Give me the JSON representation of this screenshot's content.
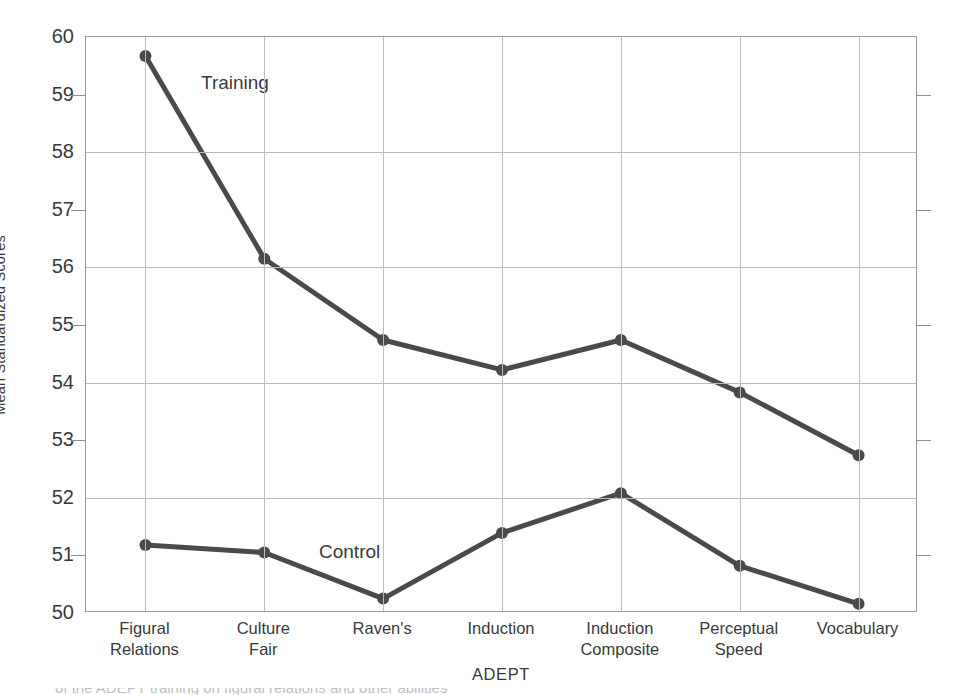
{
  "chart_data": {
    "type": "line",
    "title": "",
    "xlabel": "ADEPT",
    "ylabel": "Mean Standardized Scores",
    "ylim": [
      50,
      60
    ],
    "ytick_labels": [
      "60",
      "59",
      "58",
      "57",
      "56",
      "55",
      "54",
      "53",
      "52",
      "51",
      "50"
    ],
    "ytick_values": [
      60,
      59,
      58,
      57,
      56,
      55,
      54,
      53,
      52,
      51,
      50
    ],
    "gridline_values": [
      60,
      58,
      56,
      54,
      52,
      50
    ],
    "minor_tick_values": [
      59,
      57,
      55,
      53,
      51
    ],
    "grid": true,
    "legend_position": "inline-annotations",
    "categories": [
      "Figural Relations",
      "Culture Fair",
      "Raven's",
      "Induction",
      "Induction Composite",
      "Perceptual Speed",
      "Vocabulary"
    ],
    "category_lines": [
      [
        "Figural",
        "Relations"
      ],
      [
        "Culture",
        "Fair"
      ],
      [
        "Raven's",
        ""
      ],
      [
        "Induction",
        ""
      ],
      [
        "Induction",
        "Composite"
      ],
      [
        "Perceptual",
        "Speed"
      ],
      [
        "Vocabulary",
        ""
      ]
    ],
    "series": [
      {
        "name": "Training",
        "values": [
          59.67,
          56.15,
          54.74,
          54.22,
          54.74,
          53.83,
          52.74
        ]
      },
      {
        "name": "Control",
        "values": [
          51.18,
          51.05,
          50.25,
          51.39,
          52.08,
          50.82,
          50.16
        ]
      }
    ],
    "annotations": [
      {
        "text": "Training",
        "near": "Figural Relations"
      },
      {
        "text": "Control",
        "near": "Culture Fair"
      }
    ],
    "style": {
      "line_color": "#4a4a4a",
      "marker_color": "#4a4a4a",
      "grid_color": "#b9b9b9",
      "axis_color": "#9a9a9a",
      "background": "#ffffff",
      "line_width": 5,
      "marker_radius": 6
    }
  },
  "caption": {
    "clipped_text": "of the ADEPT training on figural relations and other abilities"
  }
}
